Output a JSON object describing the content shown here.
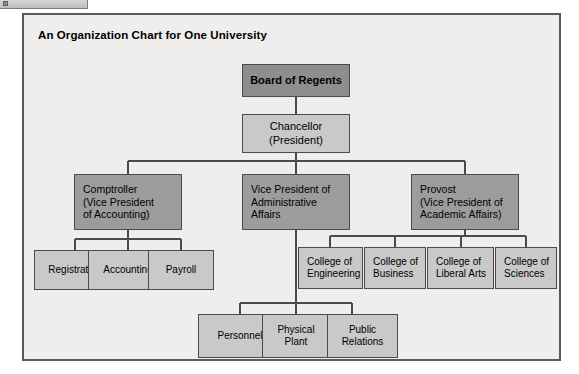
{
  "window": {
    "chrome_strip": "toolbar-fragment"
  },
  "chart": {
    "title": "An Organization Chart for One University",
    "colors": {
      "frame_background": "#efeeec",
      "frame_border": "#5a5a5a",
      "tone_dark": "#8e8e8e",
      "tone_mid": "#9c9c9c",
      "tone_light": "#c9c9c9",
      "box_border": "#4b4b4b",
      "connector": "#4b4b4b",
      "text": "#000000"
    },
    "nodes": {
      "board_of_regents": {
        "label": "Board of Regents"
      },
      "chancellor": {
        "line1": "Chancellor",
        "line2": "(President)"
      },
      "comptroller": {
        "line1": "Comptroller",
        "line2": "(Vice President",
        "line3": "of Accounting)"
      },
      "vp_administrative_affairs": {
        "line1": "Vice President of",
        "line2": "Administrative",
        "line3": "Affairs"
      },
      "provost": {
        "line1": "Provost",
        "line2": "(Vice President of",
        "line3": "Academic Affairs)"
      },
      "registration": {
        "label": "Registration"
      },
      "accounting": {
        "label": "Accounting"
      },
      "payroll": {
        "label": "Payroll"
      },
      "college_engineering": {
        "line1": "College of",
        "line2": "Engineering"
      },
      "college_business": {
        "line1": "College of",
        "line2": "Business"
      },
      "college_liberal_arts": {
        "line1": "College of",
        "line2": "Liberal Arts"
      },
      "college_sciences": {
        "line1": "College of",
        "line2": "Sciences"
      },
      "personnel": {
        "label": "Personnel"
      },
      "physical_plant": {
        "line1": "Physical",
        "line2": "Plant"
      },
      "public_relations": {
        "line1": "Public",
        "line2": "Relations"
      }
    }
  }
}
